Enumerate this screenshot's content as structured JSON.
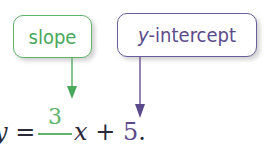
{
  "labels": {
    "slope": "slope",
    "y_intercept_var": "y",
    "y_intercept_rest": "-intercept"
  },
  "equation": {
    "lhs_var": "y",
    "equals": " = ",
    "sign": "−",
    "numerator": "3",
    "x_var": "x",
    "plus": " + ",
    "constant": "5",
    "period": "."
  },
  "colors": {
    "slope": "#5fb46a",
    "y_intercept": "#6b5c9c",
    "text": "#2a2a3a"
  }
}
